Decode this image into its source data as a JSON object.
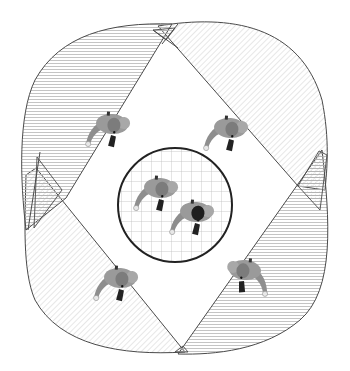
{
  "diagram": {
    "type": "top-down camera coverage / surveillance zones illustration",
    "canvas": {
      "width": 350,
      "height": 371,
      "background": "#ffffff"
    },
    "colors": {
      "outline": "#4a4a4a",
      "hatch": "#b8b8b8",
      "grid": "#bdbdbd",
      "circle_border": "#222222",
      "person_body": "#8e8e8e",
      "person_body_light": "#a9a9a9",
      "person_hair": "#6f6f6f",
      "person_dark_hair": "#1e1e1e",
      "person_legs": "#222222"
    },
    "zones": [
      {
        "id": "top-left",
        "hatch": "horizontal"
      },
      {
        "id": "top-right",
        "hatch": "diagonal"
      },
      {
        "id": "bottom-left",
        "hatch": "diagonal"
      },
      {
        "id": "bottom-right",
        "hatch": "horizontal"
      }
    ],
    "center_area": {
      "shape": "circle",
      "pattern": "grid",
      "cx": 175,
      "cy": 205,
      "r": 57
    },
    "people": [
      {
        "id": "person-top-left",
        "x": 110,
        "y": 125,
        "rot": 0
      },
      {
        "id": "person-top-right",
        "x": 228,
        "y": 128,
        "rot": 0
      },
      {
        "id": "person-bottom-left",
        "x": 118,
        "y": 280,
        "rot": 0
      },
      {
        "id": "person-bottom-right",
        "x": 240,
        "y": 268,
        "rot": 0
      },
      {
        "id": "person-center-1",
        "x": 160,
        "y": 190,
        "rot": 0
      },
      {
        "id": "person-center-2",
        "x": 197,
        "y": 213,
        "rot": 0,
        "dark_hair": true
      }
    ]
  }
}
